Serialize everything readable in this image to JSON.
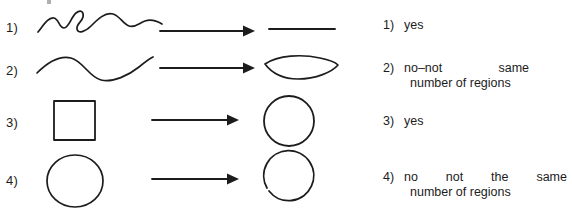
{
  "figure": {
    "width": 572,
    "height": 214,
    "background": "#ffffff",
    "ink_color": "#1c1c1c"
  },
  "rows": [
    {
      "index_label": "1)",
      "input_shape_name": "wiggly-open-curve",
      "arrow_name": "right-arrow",
      "result_shape_name": "straight-line-segment",
      "answer_number": "1)",
      "answer_lines": [
        "yes"
      ],
      "answer_justified": [
        false
      ]
    },
    {
      "index_label": "2)",
      "input_shape_name": "s-curve",
      "arrow_name": "right-arrow",
      "result_shape_name": "lens-shape",
      "answer_number": "2)",
      "answer_lines": [
        "no–not same",
        "number of regions"
      ],
      "answer_justified": [
        true,
        false
      ]
    },
    {
      "index_label": "3)",
      "input_shape_name": "square",
      "arrow_name": "right-arrow",
      "result_shape_name": "circle",
      "answer_number": "3)",
      "answer_lines": [
        "yes"
      ],
      "answer_justified": [
        false
      ]
    },
    {
      "index_label": "4)",
      "input_shape_name": "circle",
      "arrow_name": "right-arrow",
      "result_shape_name": "open-circle-with-gap",
      "answer_number": "4)",
      "answer_lines": [
        "no not the same",
        "number of regions"
      ],
      "answer_justified": [
        true,
        false
      ]
    }
  ]
}
